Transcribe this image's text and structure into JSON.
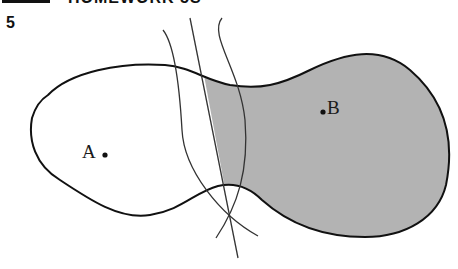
{
  "header": {
    "text": "HOMEWORK 5S"
  },
  "problem": {
    "number": "5"
  },
  "diagram": {
    "points": [
      {
        "label": "A",
        "x": 105,
        "y": 155,
        "label_side": "left"
      },
      {
        "label": "B",
        "x": 323,
        "y": 112,
        "label_side": "right"
      }
    ],
    "region_fill": "#b3b3b3",
    "stroke": "#111111",
    "construction_stroke": "#333333"
  }
}
